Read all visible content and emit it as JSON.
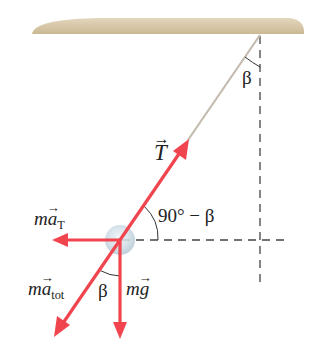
{
  "diagram": {
    "type": "free-body / conical pendulum force diagram",
    "colors": {
      "ceiling": "#d8c8a8",
      "string": "#c9c2b4",
      "force_arrow": "#f0444e",
      "dashed": "#444444",
      "ball": "#cfdde6"
    },
    "labels": {
      "tension": "T",
      "beta_top": "β",
      "angle_complement": "90° − β",
      "ma_t_m": "m",
      "ma_t_a": "a",
      "ma_t_sub": "T",
      "ma_tot_m": "m",
      "ma_tot_a": "a",
      "ma_tot_sub": "tot",
      "beta_bottom": "β",
      "mg_m": "m",
      "mg_g": "g"
    }
  }
}
